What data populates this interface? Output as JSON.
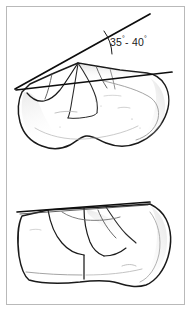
{
  "figure": {
    "background_color": "#ffffff",
    "frame_color": "#b9b9b9",
    "ink_color": "#1a1a1a",
    "shade_color": "#9a9a9a",
    "width": 191,
    "height": 312
  },
  "annotations": {
    "angle_measurement": {
      "value_min": "35",
      "value_max": "40",
      "degree_symbol": "°",
      "separator": "- ",
      "full_text": "35°- 40°"
    }
  },
  "views": {
    "upper": {
      "name": "superior-oblique-view",
      "has_angle_lines": true,
      "reference_line_label": "",
      "measured_line_label": ""
    },
    "lower": {
      "name": "lateral-view",
      "has_angle_lines": false,
      "reference_line_label": ""
    }
  },
  "elements": {
    "upper_reference_line": "upper-reference-line",
    "upper_measured_line": "upper-measured-line",
    "angle_arc": "angle-arc",
    "lower_reference_line": "lower-reference-line"
  }
}
